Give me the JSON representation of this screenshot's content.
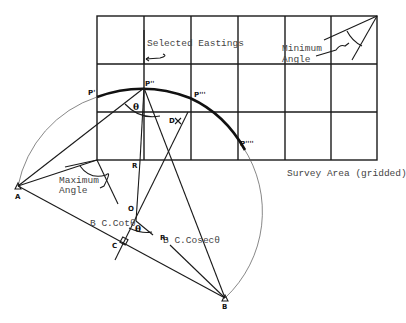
{
  "labels": {
    "selected_eastings": "Selected Eastings",
    "minimum_angle_1": "Minimum",
    "minimum_angle_2": "Angle",
    "maximum_angle_1": "Maximum",
    "maximum_angle_2": "Angle",
    "survey_area": "Survey Area (gridded)",
    "b_cot": "B C.Cotθ",
    "b_cosec": "B C.Cosecθ"
  },
  "points": {
    "A": "A",
    "B": "B",
    "C": "C",
    "O": "O",
    "R": "R",
    "R1": "R₁",
    "D": "D",
    "P1": "P'",
    "P2": "P''",
    "P3": "P'''",
    "P4": "P''''"
  },
  "angles": {
    "theta_top": "θ",
    "theta_bottom": "θ"
  },
  "colors": {
    "ink": "#1a1a1a",
    "text": "#444444",
    "background": "#ffffff"
  },
  "grid": {
    "columns": 6,
    "rows": 3
  }
}
